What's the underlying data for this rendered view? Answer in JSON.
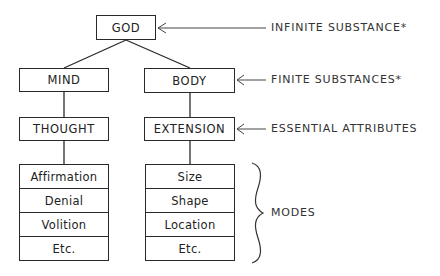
{
  "diagram": {
    "root": {
      "label": "GOD"
    },
    "substances": [
      {
        "label": "MIND",
        "attribute": "THOUGHT",
        "modes": [
          "Affirmation",
          "Denial",
          "Volition",
          "Etc."
        ]
      },
      {
        "label": "BODY",
        "attribute": "EXTENSION",
        "modes": [
          "Size",
          "Shape",
          "Location",
          "Etc."
        ]
      }
    ],
    "annotations": {
      "infinite": "INFINITE SUBSTANCE*",
      "finite": "FINITE SUBSTANCES*",
      "attributes": "ESSENTIAL ATTRIBUTES",
      "modes": "MODES"
    },
    "colors": {
      "stroke": "#2a2a2a",
      "text": "#222222",
      "background": "#ffffff"
    }
  }
}
